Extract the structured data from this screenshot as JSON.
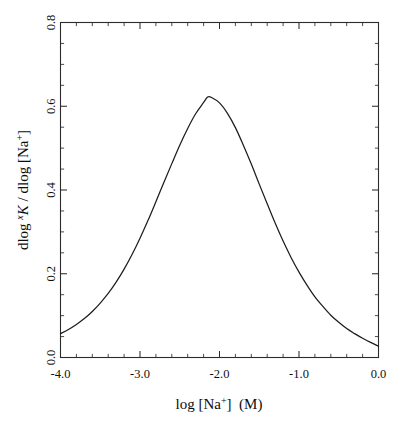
{
  "figure": {
    "background_color": "#ffffff",
    "line_color": "#1d1d1d",
    "axis_color": "#2b2b2b"
  },
  "axes": {
    "x_title_parts": {
      "lead": "log [Na",
      "charge": "+",
      "close": "]",
      "units": "(M)"
    },
    "y_title_parts": {
      "lead": "dlog ",
      "species_sup": "x",
      "species": "K",
      "mid": " / dlog [Na",
      "charge": "+",
      "close": "]"
    },
    "x_title_plain": "log [Na+]  (M)",
    "y_title_plain": "dlog xK / dlog [Na+]",
    "x_tick_labels": [
      "-4.0",
      "-3.0",
      "-2.0",
      "-1.0",
      "0.0"
    ],
    "y_tick_labels": [
      "0.0",
      "0.2",
      "0.4",
      "0.6",
      "0.8"
    ]
  },
  "chart_data": {
    "type": "line",
    "title": "",
    "xlabel": "log [Na+]  (M)",
    "ylabel": "dlog xK / dlog [Na+]",
    "xlim": [
      -4.0,
      0.0
    ],
    "ylim": [
      0.0,
      0.8
    ],
    "x_major_ticks": [
      -4.0,
      -3.0,
      -2.0,
      -1.0,
      0.0
    ],
    "y_major_ticks": [
      0.0,
      0.2,
      0.4,
      0.6,
      0.8
    ],
    "x_minor_tick_step": 0.2,
    "y_minor_tick_step": 0.05,
    "tick_direction": "in",
    "grid": false,
    "legend": null,
    "frame": "box-all-four-sides",
    "peak": {
      "x": -2.15,
      "y": 0.622
    },
    "x": [
      -4.0,
      -3.9,
      -3.8,
      -3.7,
      -3.6,
      -3.5,
      -3.4,
      -3.3,
      -3.2,
      -3.1,
      -3.0,
      -2.9,
      -2.8,
      -2.7,
      -2.6,
      -2.5,
      -2.4,
      -2.3,
      -2.2,
      -2.15,
      -2.1,
      -2.0,
      -1.9,
      -1.8,
      -1.7,
      -1.6,
      -1.5,
      -1.4,
      -1.3,
      -1.2,
      -1.1,
      -1.0,
      -0.9,
      -0.8,
      -0.7,
      -0.6,
      -0.5,
      -0.4,
      -0.3,
      -0.2,
      -0.1,
      0.0
    ],
    "y": [
      0.057,
      0.067,
      0.079,
      0.093,
      0.11,
      0.13,
      0.153,
      0.18,
      0.211,
      0.246,
      0.285,
      0.327,
      0.372,
      0.418,
      0.463,
      0.507,
      0.547,
      0.582,
      0.609,
      0.622,
      0.621,
      0.608,
      0.583,
      0.549,
      0.507,
      0.462,
      0.414,
      0.367,
      0.321,
      0.278,
      0.239,
      0.204,
      0.173,
      0.145,
      0.122,
      0.101,
      0.084,
      0.069,
      0.057,
      0.046,
      0.036,
      0.027
    ]
  }
}
